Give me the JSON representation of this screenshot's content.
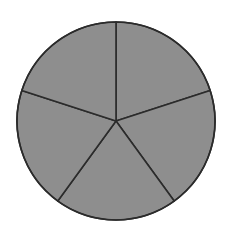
{
  "diagram": {
    "type": "pie-fraction-circle",
    "total_parts": 5,
    "shaded_parts": 5,
    "center": [
      116,
      121
    ],
    "radius": 99,
    "start_angle_deg": -90,
    "colors": {
      "fill": "#8e8e8e",
      "stroke": "#2b2b2b",
      "background": "#ffffff"
    }
  }
}
